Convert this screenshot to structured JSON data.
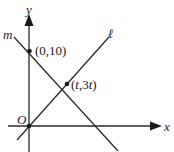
{
  "diagram": {
    "axes": {
      "x_label": "x",
      "y_label": "y",
      "origin_label": "O"
    },
    "lines": [
      {
        "name": "m",
        "label": "m"
      },
      {
        "name": "l",
        "label": "ℓ"
      }
    ],
    "points": [
      {
        "name": "y-intercept",
        "label": "(0,10)"
      },
      {
        "name": "intersection",
        "label_open": "(",
        "label_t": "t",
        "label_mid": ",3",
        "label_t2": "t",
        "label_close": ")"
      }
    ],
    "colors": {
      "stroke": "#2a2a2a",
      "background": "#ffffff"
    }
  }
}
